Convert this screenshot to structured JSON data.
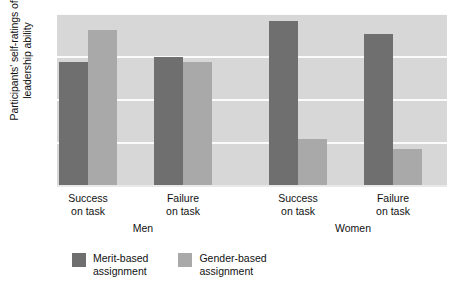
{
  "chart_data": {
    "type": "bar",
    "title": "",
    "xlabel": "",
    "ylabel": "Participants' self-ratings of leadership ability",
    "ylabel_line1": "Participants' self-ratings of",
    "ylabel_line2": "leadership ability",
    "ylim": [
      5.0,
      7.0
    ],
    "ytick_labels": [
      "7.0",
      "6.5",
      "6.0",
      "5.5",
      "5.0"
    ],
    "ytick_values": [
      7.0,
      6.5,
      6.0,
      5.5,
      5.0
    ],
    "grid": true,
    "legend_position": "bottom-left",
    "categories": [
      "Success on task",
      "Failure on task",
      "Success on task",
      "Failure on task"
    ],
    "category_lines": [
      {
        "line1": "Success",
        "line2": "on task"
      },
      {
        "line1": "Failure",
        "line2": "on task"
      },
      {
        "line1": "Success",
        "line2": "on task"
      },
      {
        "line1": "Failure",
        "line2": "on task"
      }
    ],
    "groups": [
      {
        "label": "Men",
        "categories": [
          "Success on task",
          "Failure on task"
        ]
      },
      {
        "label": "Women",
        "categories": [
          "Success on task",
          "Failure on task"
        ]
      }
    ],
    "series": [
      {
        "name": "Merit-based assignment",
        "name_line1": "Merit-based",
        "name_line2": "assignment",
        "color": "#6f6f6f",
        "values": [
          6.44,
          6.5,
          6.92,
          6.77
        ]
      },
      {
        "name": "Gender-based assignment",
        "name_line1": "Gender-based",
        "name_line2": "assignment",
        "color": "#a9a9a9",
        "values": [
          6.81,
          6.44,
          5.55,
          5.43
        ]
      }
    ],
    "plot_background": "#d7d7d7",
    "gridline_color": "#fbfbfb"
  }
}
